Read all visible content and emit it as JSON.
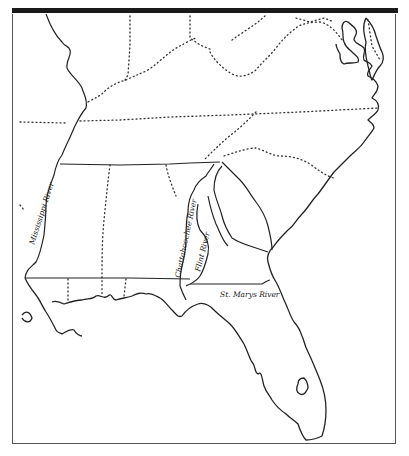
{
  "map": {
    "title": "",
    "labels": {
      "mississippi": "Mississippi River",
      "chattahoochee": "Chattahoochee River",
      "flint": "Flint River",
      "st_marys": "St. Marys River"
    },
    "colors": {
      "line": "#222222",
      "background": "#ffffff",
      "header_bar": "#1a1a1a"
    }
  }
}
